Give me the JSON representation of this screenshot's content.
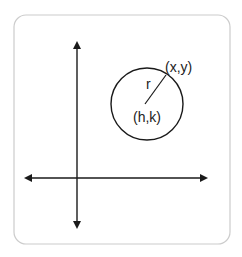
{
  "diagram": {
    "colors": {
      "stroke": "#1a1a1a",
      "frame": "#cccccc",
      "background": "#ffffff",
      "text": "#222222"
    },
    "frame": {
      "x": 14,
      "y": 15,
      "width": 216,
      "height": 229,
      "radius": 12
    },
    "axes": {
      "horizontal": {
        "y": 178,
        "x1": 24,
        "x2": 208
      },
      "vertical": {
        "x": 77,
        "y1": 41,
        "y2": 229
      }
    },
    "circle": {
      "cx": 147,
      "cy": 104,
      "r": 36
    },
    "radius_line": {
      "x1": 145,
      "y1": 104,
      "x2": 166,
      "y2": 75
    },
    "labels": {
      "point": "(x,y)",
      "radius": "r",
      "center": "(h,k)"
    }
  }
}
